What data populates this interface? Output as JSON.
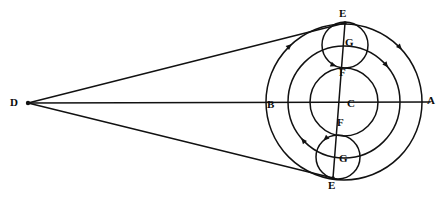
{
  "figure": {
    "kind": "geometric-diagram",
    "title": "",
    "background_color": "#ffffff",
    "ink_color": "#111111",
    "width": 444,
    "height": 199
  },
  "labels": [
    {
      "id": "label-D",
      "text": "D",
      "x": 10,
      "y": 97
    },
    {
      "id": "label-B",
      "text": "B",
      "x": 267,
      "y": 99
    },
    {
      "id": "label-C",
      "text": "C",
      "x": 347,
      "y": 98
    },
    {
      "id": "label-A",
      "text": "A",
      "x": 427,
      "y": 95
    },
    {
      "id": "label-E-top",
      "text": "E",
      "x": 339,
      "y": 8
    },
    {
      "id": "label-G-top",
      "text": "G",
      "x": 345,
      "y": 37
    },
    {
      "id": "label-F-top",
      "text": "F",
      "x": 339,
      "y": 67
    },
    {
      "id": "label-F-bottom",
      "text": "F",
      "x": 337,
      "y": 117
    },
    {
      "id": "label-G-bottom",
      "text": "G",
      "x": 339,
      "y": 153
    },
    {
      "id": "label-E-bottom",
      "text": "E",
      "x": 328,
      "y": 180
    }
  ],
  "points": {
    "D": {
      "x": 28,
      "y": 103
    },
    "A": {
      "x": 422,
      "y": 102
    },
    "B": {
      "x": 266,
      "y": 102
    },
    "C": {
      "x": 344,
      "y": 102
    },
    "E_top": {
      "x": 345,
      "y": 23
    },
    "E_bottom": {
      "x": 333,
      "y": 178
    },
    "F_top": {
      "x": 344,
      "y": 68
    },
    "F_bottom": {
      "x": 340,
      "y": 136
    },
    "G_top": {
      "x": 345,
      "y": 45
    },
    "G_bottom": {
      "x": 338,
      "y": 157
    }
  },
  "circles": [
    {
      "id": "circle-outer-BA",
      "cx": 344,
      "cy": 102,
      "r": 78
    },
    {
      "id": "circle-second",
      "cx": 344,
      "cy": 102,
      "r": 56
    },
    {
      "id": "circle-inner-FF",
      "cx": 344,
      "cy": 102,
      "r": 34
    },
    {
      "id": "circle-epicycle-top",
      "cx": 345,
      "cy": 45,
      "r": 23
    },
    {
      "id": "circle-epicycle-bottom",
      "cx": 338,
      "cy": 157,
      "r": 22
    }
  ],
  "lines": [
    {
      "id": "line-D-to-E-top",
      "x1": 28,
      "y1": 103,
      "x2": 345,
      "y2": 23
    },
    {
      "id": "line-D-to-A-axis",
      "x1": 28,
      "y1": 103,
      "x2": 430,
      "y2": 102
    },
    {
      "id": "line-D-to-E-bottom",
      "x1": 28,
      "y1": 103,
      "x2": 333,
      "y2": 178
    },
    {
      "id": "line-chord-E-to-E",
      "x1": 345,
      "y1": 23,
      "x2": 333,
      "y2": 178
    }
  ],
  "arrow_marks": [
    {
      "id": "arrow-outer-upper-left",
      "cx": 344,
      "cy": 102,
      "r": 78,
      "angle_deg": 228,
      "direction": "cw"
    },
    {
      "id": "arrow-outer-upper-right",
      "cx": 344,
      "cy": 102,
      "r": 78,
      "angle_deg": 318,
      "direction": "cw"
    },
    {
      "id": "arrow-second-right",
      "cx": 344,
      "cy": 102,
      "r": 56,
      "angle_deg": 322,
      "direction": "cw"
    },
    {
      "id": "arrow-second-left",
      "cx": 344,
      "cy": 102,
      "r": 56,
      "angle_deg": 140,
      "direction": "cw"
    },
    {
      "id": "arrow-epicycle-top",
      "cx": 345,
      "cy": 45,
      "r": 23,
      "angle_deg": 112,
      "direction": "ccw"
    },
    {
      "id": "arrow-epicycle-bottom",
      "cx": 338,
      "cy": 157,
      "r": 22,
      "angle_deg": 228,
      "direction": "ccw"
    }
  ]
}
